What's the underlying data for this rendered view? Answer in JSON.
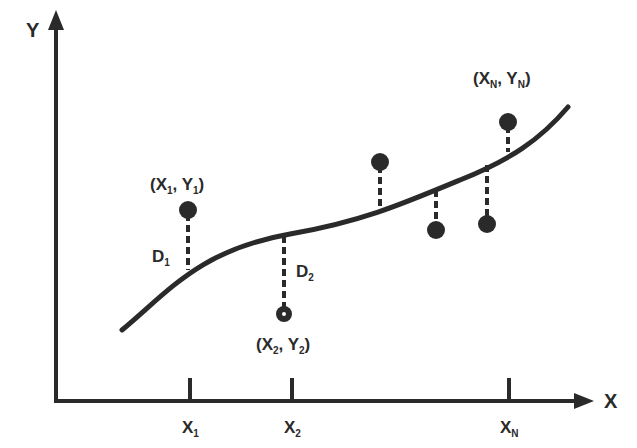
{
  "diagram": {
    "type": "least-squares curve fit illustration",
    "axes": {
      "x_label": "X",
      "y_label": "Y",
      "x_ticks": [
        {
          "base": "X",
          "sub": "1"
        },
        {
          "base": "X",
          "sub": "2"
        },
        {
          "base": "X",
          "sub": "N"
        }
      ]
    },
    "point_labels": {
      "p1": {
        "open": "(X",
        "sub1": "1",
        "mid": ", Y",
        "sub2": "1",
        "close": ")"
      },
      "p2": {
        "open": "(X",
        "sub1": "2",
        "mid": ", Y",
        "sub2": "2",
        "close": ")"
      },
      "pn": {
        "open": "(X",
        "sub1": "N",
        "mid": ", Y",
        "sub2": "N",
        "close": ")"
      }
    },
    "deviation_labels": {
      "d1": {
        "base": "D",
        "sub": "1"
      },
      "d2": {
        "base": "D",
        "sub": "2"
      }
    },
    "data_points": [
      {
        "name": "X1,Y1",
        "side": "above"
      },
      {
        "name": "X2,Y2",
        "side": "below"
      },
      {
        "name": "point-3",
        "side": "above"
      },
      {
        "name": "point-4",
        "side": "below"
      },
      {
        "name": "point-5",
        "side": "below"
      },
      {
        "name": "XN,YN",
        "side": "above"
      }
    ],
    "colors": {
      "ink": "#2a2a2a",
      "background": "#ffffff"
    }
  }
}
